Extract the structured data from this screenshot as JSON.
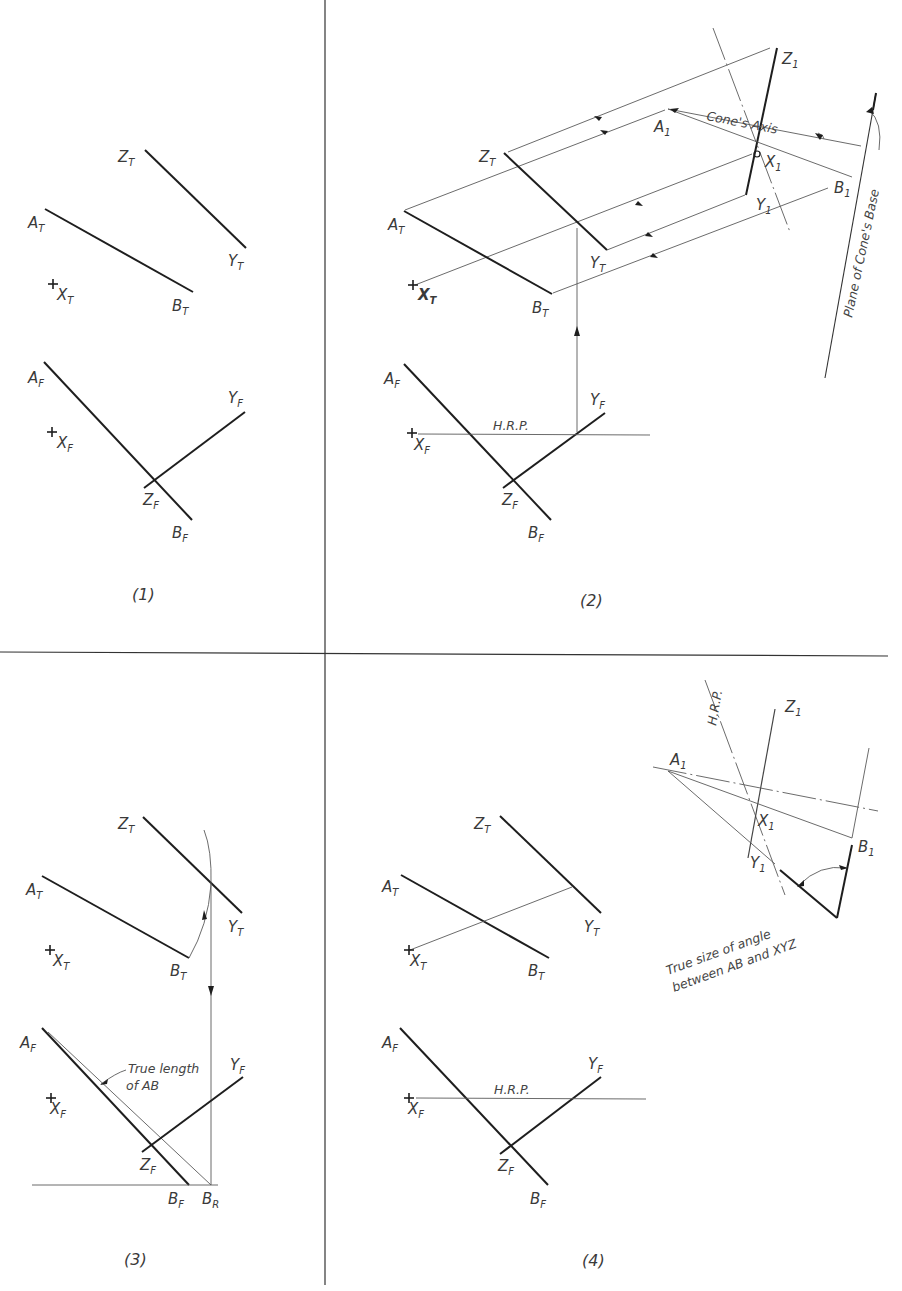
{
  "figure": {
    "background": "#ffffff",
    "ink_color": "#1e1e1e",
    "panels": [
      {
        "caption": "(1)",
        "top_view_labels": {
          "A": "A",
          "B": "B",
          "X": "X",
          "Y": "Y",
          "Z": "Z",
          "sub": "T"
        },
        "front_view_labels": {
          "A": "A",
          "B": "B",
          "X": "X",
          "Y": "Y",
          "Z": "Z",
          "sub": "F"
        }
      },
      {
        "caption": "(2)",
        "top_view_labels": {
          "A": "A",
          "B": "B",
          "X": "X",
          "Y": "Y",
          "Z": "Z",
          "sub": "T"
        },
        "front_view_labels": {
          "A": "A",
          "B": "B",
          "X": "X",
          "Y": "Y",
          "Z": "Z",
          "sub": "F"
        },
        "aux_view_labels": {
          "A": "A",
          "B": "B",
          "X": "X",
          "Y": "Y",
          "Z": "Z",
          "sub": "1"
        },
        "hrp_label": "H.R.P.",
        "cone_axis_label": "Cone's Axis",
        "plane_label": "Plane of Cone's Base"
      },
      {
        "caption": "(3)",
        "top_view_labels": {
          "A": "A",
          "B": "B",
          "X": "X",
          "Y": "Y",
          "Z": "Z",
          "sub": "T"
        },
        "front_view_labels": {
          "A": "A",
          "B": "B",
          "X": "X",
          "Y": "Y",
          "Z": "Z",
          "sub": "F"
        },
        "revolved_label": "B",
        "revolved_sub": "R",
        "true_length_note_line1": "True length",
        "true_length_note_line2": "of AB"
      },
      {
        "caption": "(4)",
        "top_view_labels": {
          "A": "A",
          "B": "B",
          "X": "X",
          "Y": "Y",
          "Z": "Z",
          "sub": "T"
        },
        "front_view_labels": {
          "A": "A",
          "B": "B",
          "X": "X",
          "Y": "Y",
          "Z": "Z",
          "sub": "F"
        },
        "aux_view_labels": {
          "A": "A",
          "B": "B",
          "X": "X",
          "Y": "Y",
          "Z": "Z",
          "sub": "1"
        },
        "hrp_label": "H.R.P.",
        "hrp_label_aux": "H.R.P.",
        "angle_note_line1": "True size of angle",
        "angle_note_line2": "between AB and XYZ"
      }
    ]
  }
}
